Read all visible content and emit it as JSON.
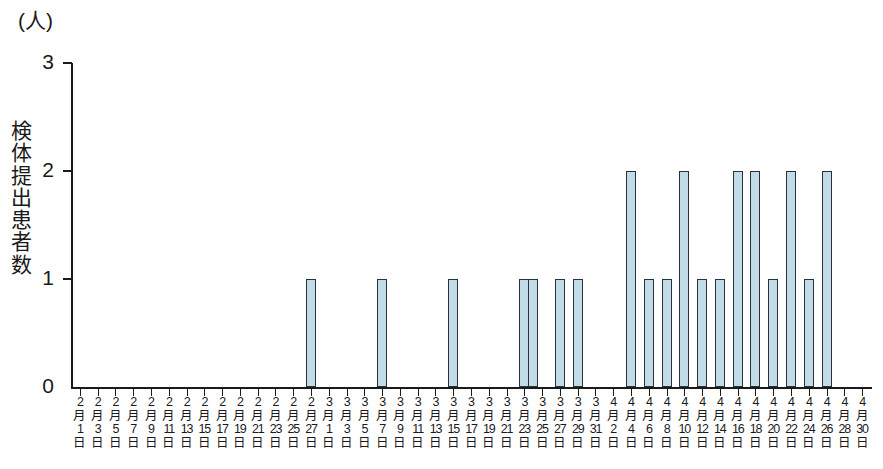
{
  "chart_data": {
    "type": "bar",
    "title": "",
    "subtitle": "",
    "unit_label": "(人)",
    "ylabel": "検体提出患者数",
    "xlabel": "",
    "ylim": [
      0,
      3
    ],
    "y_ticks": [
      0,
      1,
      2,
      3
    ],
    "y_tick_labels": [
      "0",
      "1",
      "2",
      "3"
    ],
    "grid": false,
    "legend": null,
    "x_axis_note": "Daily dates from 2月1日 to 4月30日; tick labels shown every 2 days",
    "x_tick_labels": [
      "2月1日",
      "2月3日",
      "2月5日",
      "2月7日",
      "2月9日",
      "2月11日",
      "2月13日",
      "2月15日",
      "2月17日",
      "2月19日",
      "2月21日",
      "2月23日",
      "2月25日",
      "2月27日",
      "3月1日",
      "3月3日",
      "3月5日",
      "3月7日",
      "3月9日",
      "3月11日",
      "3月13日",
      "3月15日",
      "3月17日",
      "3月19日",
      "3月21日",
      "3月23日",
      "3月25日",
      "3月27日",
      "3月29日",
      "3月31日",
      "4月2日",
      "4月4日",
      "4月6日",
      "4月8日",
      "4月10日",
      "4月12日",
      "4月14日",
      "4月16日",
      "4月18日",
      "4月20日",
      "4月22日",
      "4月24日",
      "4月26日",
      "4月28日",
      "4月30日"
    ],
    "categories": [
      "2月1日",
      "2月2日",
      "2月3日",
      "2月4日",
      "2月5日",
      "2月6日",
      "2月7日",
      "2月8日",
      "2月9日",
      "2月10日",
      "2月11日",
      "2月12日",
      "2月13日",
      "2月14日",
      "2月15日",
      "2月16日",
      "2月17日",
      "2月18日",
      "2月19日",
      "2月20日",
      "2月21日",
      "2月22日",
      "2月23日",
      "2月24日",
      "2月25日",
      "2月26日",
      "2月27日",
      "2月28日",
      "3月1日",
      "3月2日",
      "3月3日",
      "3月4日",
      "3月5日",
      "3月6日",
      "3月7日",
      "3月8日",
      "3月9日",
      "3月10日",
      "3月11日",
      "3月12日",
      "3月13日",
      "3月14日",
      "3月15日",
      "3月16日",
      "3月17日",
      "3月18日",
      "3月19日",
      "3月20日",
      "3月21日",
      "3月22日",
      "3月23日",
      "3月24日",
      "3月25日",
      "3月26日",
      "3月27日",
      "3月28日",
      "3月29日",
      "3月30日",
      "3月31日",
      "4月1日",
      "4月2日",
      "4月3日",
      "4月4日",
      "4月5日",
      "4月6日",
      "4月7日",
      "4月8日",
      "4月9日",
      "4月10日",
      "4月11日",
      "4月12日",
      "4月13日",
      "4月14日",
      "4月15日",
      "4月16日",
      "4月17日",
      "4月18日",
      "4月19日",
      "4月20日",
      "4月21日",
      "4月22日",
      "4月23日",
      "4月24日",
      "4月25日",
      "4月26日",
      "4月27日",
      "4月28日",
      "4月29日",
      "4月30日"
    ],
    "values": [
      0,
      0,
      0,
      0,
      0,
      0,
      0,
      0,
      0,
      0,
      0,
      0,
      0,
      0,
      0,
      0,
      0,
      0,
      0,
      0,
      0,
      0,
      0,
      0,
      0,
      0,
      1,
      0,
      0,
      0,
      0,
      0,
      0,
      0,
      1,
      0,
      0,
      0,
      0,
      0,
      0,
      0,
      1,
      0,
      0,
      0,
      0,
      0,
      0,
      0,
      1,
      1,
      0,
      0,
      1,
      0,
      1,
      0,
      0,
      0,
      0,
      0,
      2,
      0,
      1,
      0,
      1,
      0,
      2,
      0,
      1,
      0,
      1,
      0,
      2,
      0,
      2,
      0,
      1,
      0,
      2,
      0,
      1,
      0,
      2,
      0,
      0,
      0,
      0
    ],
    "bar_color": "#c2dbe8",
    "bar_edge_color": "#2b3136",
    "axis_color": "#1a1a1a"
  }
}
